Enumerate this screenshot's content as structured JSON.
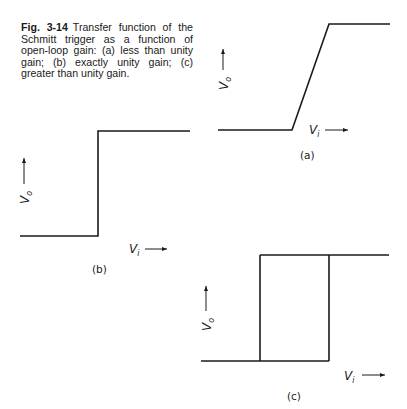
{
  "caption": {
    "figure_number": "Fig. 3-14",
    "text": "Transfer function of the Schmitt trigger as a function of open-loop gain: (a) less than unity gain; (b) exactly unity gain; (c) greater than unity gain."
  },
  "axes": {
    "output_label": "V",
    "output_subscript": "o",
    "input_label": "V",
    "input_subscript": "i"
  },
  "panels": [
    {
      "id": "a",
      "label": "(a)",
      "description": "less than unity gain — finite-slope ramp between low and high output"
    },
    {
      "id": "b",
      "label": "(b)",
      "description": "exactly unity gain — vertical step"
    },
    {
      "id": "c",
      "label": "(c)",
      "description": "greater than unity gain — hysteresis loop"
    }
  ],
  "colors": {
    "line": "#1a1a1a",
    "background": "#ffffff"
  }
}
